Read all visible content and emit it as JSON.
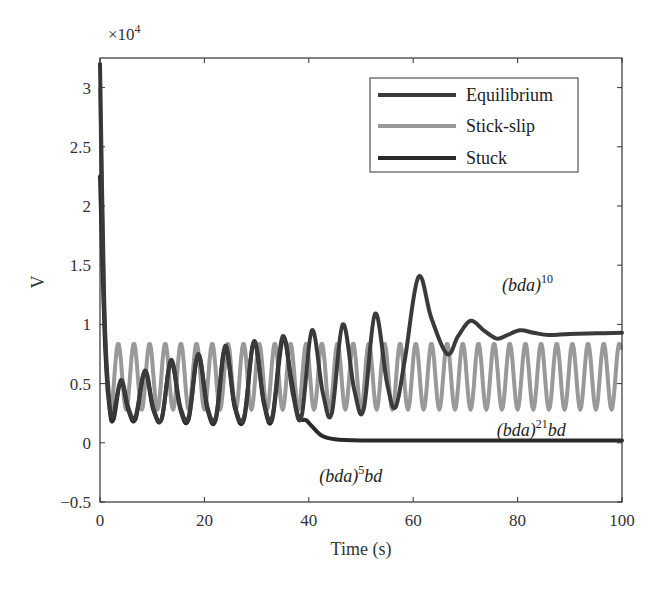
{
  "chart_data": {
    "type": "line",
    "title": "",
    "xlabel": "Time (s)",
    "ylabel": "V",
    "y_multiplier": "×10^4",
    "xlim": [
      0,
      100
    ],
    "ylim": [
      -0.5,
      3.25
    ],
    "xticks": [
      0,
      20,
      40,
      60,
      80,
      100
    ],
    "yticks": [
      -0.5,
      0,
      0.5,
      1,
      1.5,
      2,
      2.5,
      3
    ],
    "ytick_labels": [
      "−0.5",
      "0",
      "0.5",
      "1",
      "1.5",
      "2",
      "2.5",
      "3"
    ],
    "grid": false,
    "legend_position": "upper right",
    "series": [
      {
        "name": "Equilibrium",
        "color": "#3a3a3a",
        "width": 4,
        "points": [
          [
            0,
            3.2
          ],
          [
            0.8,
            1.2
          ],
          [
            1.6,
            0.45
          ],
          [
            2.4,
            0.22
          ],
          [
            4,
            0.53
          ],
          [
            5.4,
            0.3
          ],
          [
            6.8,
            0.22
          ],
          [
            8.6,
            0.61
          ],
          [
            10.2,
            0.3
          ],
          [
            11.8,
            0.2
          ],
          [
            13.6,
            0.7
          ],
          [
            15.4,
            0.3
          ],
          [
            17,
            0.22
          ],
          [
            18.8,
            0.75
          ],
          [
            20.6,
            0.3
          ],
          [
            22.2,
            0.22
          ],
          [
            24,
            0.82
          ],
          [
            25.8,
            0.32
          ],
          [
            27.6,
            0.22
          ],
          [
            29.5,
            0.86
          ],
          [
            31.4,
            0.35
          ],
          [
            33,
            0.22
          ],
          [
            35,
            0.9
          ],
          [
            37,
            0.4
          ],
          [
            38.6,
            0.22
          ],
          [
            40.6,
            0.95
          ],
          [
            42.7,
            0.42
          ],
          [
            44.4,
            0.25
          ],
          [
            46.5,
            1.0
          ],
          [
            48.7,
            0.45
          ],
          [
            50.5,
            0.28
          ],
          [
            52.7,
            1.09
          ],
          [
            55,
            0.5
          ],
          [
            56.6,
            0.3
          ],
          [
            58.4,
            0.7
          ],
          [
            61,
            1.4
          ],
          [
            63.5,
            1.05
          ],
          [
            66.5,
            0.75
          ],
          [
            68.6,
            0.9
          ],
          [
            71,
            1.03
          ],
          [
            73.5,
            0.95
          ],
          [
            76,
            0.88
          ],
          [
            78,
            0.91
          ],
          [
            80.5,
            0.95
          ],
          [
            83,
            0.93
          ],
          [
            86,
            0.91
          ],
          [
            90,
            0.92
          ],
          [
            95,
            0.925
          ],
          [
            100,
            0.93
          ]
        ]
      },
      {
        "name": "Stick-slip",
        "color": "#999999",
        "width": 4,
        "generator": {
          "start": [
            [
              0,
              3.0
            ],
            [
              0.7,
              1.2
            ],
            [
              1.4,
              0.45
            ]
          ],
          "t0": 2.0,
          "period": 3.0,
          "low": 0.28,
          "high": 0.84,
          "t_end": 100
        }
      },
      {
        "name": "Stuck",
        "color": "#2a2a2a",
        "width": 4,
        "points": [
          [
            0,
            2.25
          ],
          [
            0.9,
            0.9
          ],
          [
            1.8,
            0.3
          ],
          [
            2.6,
            0.2
          ],
          [
            4,
            0.52
          ],
          [
            5.4,
            0.28
          ],
          [
            6.8,
            0.2
          ],
          [
            8.6,
            0.6
          ],
          [
            10.2,
            0.28
          ],
          [
            11.8,
            0.2
          ],
          [
            13.6,
            0.68
          ],
          [
            15.4,
            0.28
          ],
          [
            17,
            0.2
          ],
          [
            18.8,
            0.74
          ],
          [
            20.6,
            0.28
          ],
          [
            22.2,
            0.2
          ],
          [
            24,
            0.8
          ],
          [
            25.8,
            0.3
          ],
          [
            27.6,
            0.2
          ],
          [
            29.5,
            0.85
          ],
          [
            31.4,
            0.33
          ],
          [
            33,
            0.2
          ],
          [
            35,
            0.88
          ],
          [
            36.6,
            0.55
          ],
          [
            37.6,
            0.28
          ],
          [
            38.4,
            0.2
          ],
          [
            39.5,
            0.19
          ],
          [
            40.6,
            0.14
          ],
          [
            42.5,
            0.06
          ],
          [
            45,
            0.03
          ],
          [
            50,
            0.02
          ],
          [
            60,
            0.02
          ],
          [
            80,
            0.02
          ],
          [
            100,
            0.02
          ]
        ]
      }
    ],
    "annotations": [
      {
        "base": "(bda)",
        "sup": "10",
        "tail": "",
        "x": 77,
        "y": 1.28
      },
      {
        "base": "(bda)",
        "sup": "21",
        "tail": "bd",
        "x": 76,
        "y": 0.06
      },
      {
        "base": "(bda)",
        "sup": "5",
        "tail": "bd",
        "x": 42,
        "y": -0.33
      }
    ]
  },
  "axes": {
    "multiplier_base": "×10",
    "multiplier_exp": "4"
  },
  "legend": {
    "items": [
      {
        "label": "Equilibrium"
      },
      {
        "label": "Stick-slip"
      },
      {
        "label": "Stuck"
      }
    ]
  }
}
